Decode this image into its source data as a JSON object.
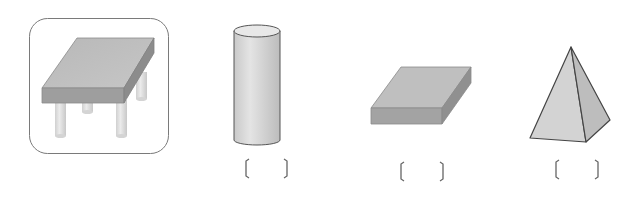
{
  "figures": [
    {
      "id": "table",
      "label": "table-with-rectangular-top",
      "highlighted": true
    },
    {
      "id": "cylinder",
      "label": "cylinder",
      "answer_blank": {
        "open": "[",
        "close": "]",
        "value": ""
      }
    },
    {
      "id": "slab",
      "label": "rectangular-prism",
      "answer_blank": {
        "open": "[",
        "close": "]",
        "value": ""
      }
    },
    {
      "id": "pyramid",
      "label": "square-pyramid",
      "answer_blank": {
        "open": "[",
        "close": "]",
        "value": ""
      }
    }
  ],
  "colors": {
    "frame_stroke": "#7a7a7a",
    "top_face": "#b3b3b3",
    "front_face": "#9a9a9a",
    "side_face": "#8a8a8a",
    "leg": "#dadada",
    "cylinder_body": "#d6d6d6",
    "cylinder_top": "#e6e6e6",
    "pyramid_front": "#d2d2d2",
    "pyramid_side": "#bdbdbd",
    "bracket": "#555555"
  }
}
